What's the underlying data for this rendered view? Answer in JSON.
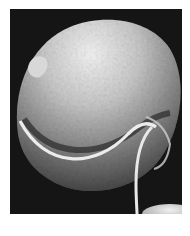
{
  "image": {
    "subject": "scanning electron micrograph of a spherical microorganism with flagella",
    "alt": "Grayscale SEM image of a round textured cell with a transverse groove and trailing flagella",
    "colors": {
      "background": "#ffffff",
      "frame": "#151515",
      "cell_highlight": "#f2f2f2",
      "cell_mid": "#9a9a9a",
      "cell_shadow": "#3a3a3a",
      "flagellum": "#e8e8e8"
    }
  }
}
